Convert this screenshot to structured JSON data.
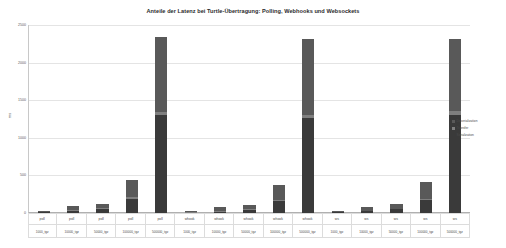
{
  "chart_data": {
    "type": "bar",
    "stacked": true,
    "title": "Anteile der Latenz bei Turtle-Übertragung: Polling, Webhooks und Websockets",
    "xlabel": "",
    "ylabel": "ms",
    "ylim": [
      0,
      2500
    ],
    "yticks": [
      0,
      500,
      1000,
      1500,
      2000,
      2500
    ],
    "ytick_labels": [
      "0",
      "500",
      "1000",
      "1500",
      "2000",
      "2500"
    ],
    "grid": true,
    "legend_position": "right",
    "legend": [
      "Deserialization",
      "Transfer",
      "Serialization"
    ],
    "colors": {
      "deserialization": "#595959",
      "transfer": "#7f7f7f",
      "serialization": "#3a3a3a"
    },
    "categories": [
      "poll\n1000_tgz",
      "poll\n10000_tgz",
      "poll\n50000_tgz",
      "poll\n100000_tgz",
      "poll\n500000_tgz",
      "whook\n1000_tgz",
      "whook\n10000_tgz",
      "whook\n50000_tgz",
      "whook\n100000_tgz",
      "whook\n500000_tgz",
      "ws\n1000_tgz",
      "ws\n10000_tgz",
      "ws\n50000_tgz",
      "ws\n100000_tgz",
      "ws\n500000_tgz"
    ],
    "group_labels": [
      "poll",
      "poll",
      "poll",
      "poll",
      "poll",
      "whook",
      "whook",
      "whook",
      "whook",
      "whook",
      "ws",
      "ws",
      "ws",
      "ws",
      "ws"
    ],
    "size_labels": [
      "1000_tgz",
      "10000_tgz",
      "50000_tgz",
      "100000_tgz",
      "500000_tgz",
      "1000_tgz",
      "10000_tgz",
      "50000_tgz",
      "100000_tgz",
      "500000_tgz",
      "1000_tgz",
      "10000_tgz",
      "50000_tgz",
      "100000_tgz",
      "500000_tgz"
    ],
    "series": [
      {
        "name": "Serialization",
        "values": [
          8,
          30,
          55,
          190,
          1300,
          6,
          20,
          45,
          160,
          1270,
          7,
          22,
          48,
          175,
          1310
        ]
      },
      {
        "name": "Transfer",
        "values": [
          2,
          6,
          10,
          20,
          45,
          2,
          5,
          9,
          18,
          40,
          2,
          5,
          9,
          18,
          42
        ]
      },
      {
        "name": "Deserialization",
        "values": [
          20,
          55,
          55,
          230,
          1000,
          16,
          50,
          55,
          200,
          1010,
          18,
          55,
          58,
          215,
          960
        ]
      }
    ],
    "totals": [
      30,
      91,
      120,
      440,
      2345,
      24,
      75,
      109,
      378,
      2320,
      27,
      82,
      115,
      408,
      2312
    ]
  }
}
